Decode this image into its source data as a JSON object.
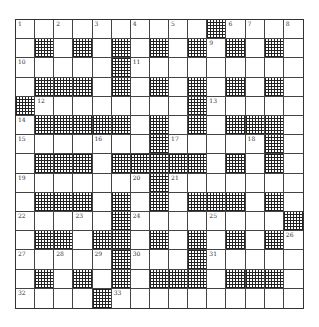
{
  "puzzle": {
    "rows": 15,
    "cols": 15,
    "layout": [
      "..........#....",
      ".#.#.#.#.#.#.#.",
      ".....#.........",
      ".###.#.#.#.#.#.",
      "#........#.....",
      ".#####.#.#.###.",
      ".......#.....#.",
      ".###.#####.#.#.",
      ".......#.......",
      ".###.#.#.###.#.",
      ".....#........#",
      ".##.##.#.#.#.#.",
      ".....#...#.....",
      ".#.#.#.###.###.",
      "....#.........."
    ],
    "numbers": [
      {
        "r": 0,
        "c": 0,
        "n": "1"
      },
      {
        "r": 0,
        "c": 2,
        "n": "2"
      },
      {
        "r": 0,
        "c": 4,
        "n": "3"
      },
      {
        "r": 0,
        "c": 6,
        "n": "4"
      },
      {
        "r": 0,
        "c": 8,
        "n": "5"
      },
      {
        "r": 0,
        "c": 11,
        "n": "6"
      },
      {
        "r": 0,
        "c": 12,
        "n": "7"
      },
      {
        "r": 0,
        "c": 14,
        "n": "8"
      },
      {
        "r": 1,
        "c": 10,
        "n": "9"
      },
      {
        "r": 2,
        "c": 0,
        "n": "10"
      },
      {
        "r": 2,
        "c": 6,
        "n": "11"
      },
      {
        "r": 4,
        "c": 1,
        "n": "12"
      },
      {
        "r": 4,
        "c": 10,
        "n": "13"
      },
      {
        "r": 5,
        "c": 0,
        "n": "14"
      },
      {
        "r": 6,
        "c": 0,
        "n": "15"
      },
      {
        "r": 6,
        "c": 4,
        "n": "16"
      },
      {
        "r": 6,
        "c": 8,
        "n": "17"
      },
      {
        "r": 6,
        "c": 12,
        "n": "18"
      },
      {
        "r": 8,
        "c": 0,
        "n": "19"
      },
      {
        "r": 8,
        "c": 6,
        "n": "20"
      },
      {
        "r": 8,
        "c": 8,
        "n": "21"
      },
      {
        "r": 10,
        "c": 0,
        "n": "22"
      },
      {
        "r": 10,
        "c": 3,
        "n": "23"
      },
      {
        "r": 10,
        "c": 6,
        "n": "24"
      },
      {
        "r": 10,
        "c": 10,
        "n": "25"
      },
      {
        "r": 11,
        "c": 14,
        "n": "26"
      },
      {
        "r": 12,
        "c": 0,
        "n": "27"
      },
      {
        "r": 12,
        "c": 2,
        "n": "28"
      },
      {
        "r": 12,
        "c": 4,
        "n": "29"
      },
      {
        "r": 12,
        "c": 6,
        "n": "30"
      },
      {
        "r": 12,
        "c": 10,
        "n": "31"
      },
      {
        "r": 14,
        "c": 0,
        "n": "32"
      },
      {
        "r": 14,
        "c": 5,
        "n": "33"
      }
    ]
  },
  "colors": {
    "grid_line": "#444444",
    "block_hatch": "#222222",
    "background": "#ffffff"
  }
}
